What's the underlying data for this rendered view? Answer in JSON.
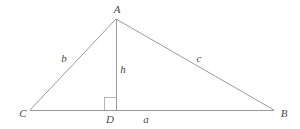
{
  "diagram": {
    "background_color": "#ffffff",
    "stroke_color": "#9a9a9a",
    "label_color": "#4a4a4a",
    "stroke_width": 1,
    "vertices": [
      {
        "id": "A",
        "label": "A",
        "x": 116,
        "y": 19
      },
      {
        "id": "B",
        "label": "B",
        "x": 274,
        "y": 110
      },
      {
        "id": "C",
        "label": "C",
        "x": 30,
        "y": 110
      },
      {
        "id": "D",
        "label": "D",
        "x": 116,
        "y": 110
      }
    ],
    "segments": [
      {
        "id": "CA",
        "from": "C",
        "to": "A",
        "label": "b"
      },
      {
        "id": "AB",
        "from": "A",
        "to": "B",
        "label": "c"
      },
      {
        "id": "CB",
        "from": "C",
        "to": "B",
        "label": "a"
      },
      {
        "id": "AD",
        "from": "A",
        "to": "D",
        "label": "h"
      }
    ],
    "side_labels": {
      "b": "b",
      "c": "c",
      "a": "a",
      "h": "h"
    },
    "right_angle": {
      "at": "D",
      "size": 12,
      "marker": "square"
    }
  }
}
